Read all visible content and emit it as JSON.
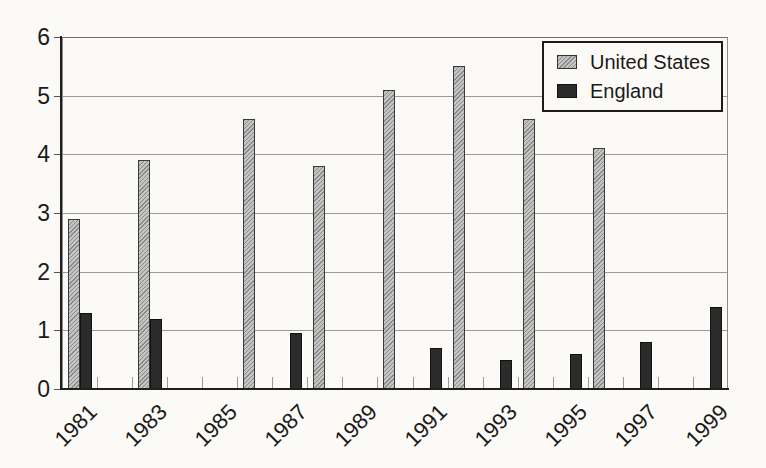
{
  "chart_data": {
    "type": "bar",
    "title": "",
    "xlabel": "",
    "ylabel": "",
    "ylim": [
      0,
      6
    ],
    "yticks": [
      0,
      1,
      2,
      3,
      4,
      5,
      6
    ],
    "year_range": [
      1981,
      1999
    ],
    "x_tick_labels": [
      "1981",
      "1983",
      "1985",
      "1987",
      "1989",
      "1991",
      "1993",
      "1995",
      "1997",
      "1999"
    ],
    "grid": "horizontal-only",
    "legend_position": "top-right-inside",
    "series": [
      {
        "name": "United States",
        "style": "hatched-light-gray",
        "points": [
          {
            "year": 1981,
            "value": 2.9
          },
          {
            "year": 1983,
            "value": 3.9
          },
          {
            "year": 1986,
            "value": 4.6
          },
          {
            "year": 1988,
            "value": 3.8
          },
          {
            "year": 1990,
            "value": 5.1
          },
          {
            "year": 1992,
            "value": 5.5
          },
          {
            "year": 1994,
            "value": 4.6
          },
          {
            "year": 1996,
            "value": 4.1
          }
        ]
      },
      {
        "name": "England",
        "style": "solid-dark",
        "points": [
          {
            "year": 1981,
            "value": 1.3
          },
          {
            "year": 1983,
            "value": 1.2
          },
          {
            "year": 1987,
            "value": 0.95
          },
          {
            "year": 1991,
            "value": 0.7
          },
          {
            "year": 1993,
            "value": 0.5
          },
          {
            "year": 1995,
            "value": 0.6
          },
          {
            "year": 1997,
            "value": 0.8
          },
          {
            "year": 1999,
            "value": 1.4
          }
        ]
      }
    ]
  },
  "colors": {
    "background": "#fbfaf6",
    "text": "#1a1a1a",
    "axis": "#1f1f1f",
    "gridline": "#9a9a9a",
    "tick": "#999999",
    "us_bar_base": "#c4c4c4",
    "us_bar_hatch": "#8a8a8a",
    "england_bar": "#2b2b2b",
    "legend_border": "#1c1c1c"
  }
}
